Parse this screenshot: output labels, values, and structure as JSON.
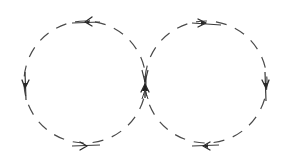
{
  "diagram": {
    "width": 283,
    "height": 158,
    "stroke_color": "#4a4a4a",
    "stroke_width": 1.2,
    "dash_pattern": "11 9",
    "circles": [
      {
        "id": "left-orbit",
        "cx": 85,
        "cy": 82,
        "r": 61,
        "direction": "counter-clockwise",
        "arrows": [
          {
            "position": "top",
            "x": 87,
            "y": 22,
            "points": "left"
          },
          {
            "position": "left",
            "x": 25,
            "y": 85,
            "points": "down"
          },
          {
            "position": "bottom",
            "x": 82,
            "y": 146,
            "points": "right"
          }
        ]
      },
      {
        "id": "right-orbit",
        "cx": 206,
        "cy": 82,
        "r": 61,
        "direction": "clockwise",
        "arrows": [
          {
            "position": "top",
            "x": 204,
            "y": 23,
            "points": "right"
          },
          {
            "position": "right",
            "x": 266,
            "y": 85,
            "points": "down"
          },
          {
            "position": "bottom",
            "x": 206,
            "y": 146,
            "points": "left"
          }
        ]
      }
    ],
    "junction": {
      "x": 145,
      "y": 82,
      "description": "tangent point with converging double arrowhead pointing up"
    }
  }
}
